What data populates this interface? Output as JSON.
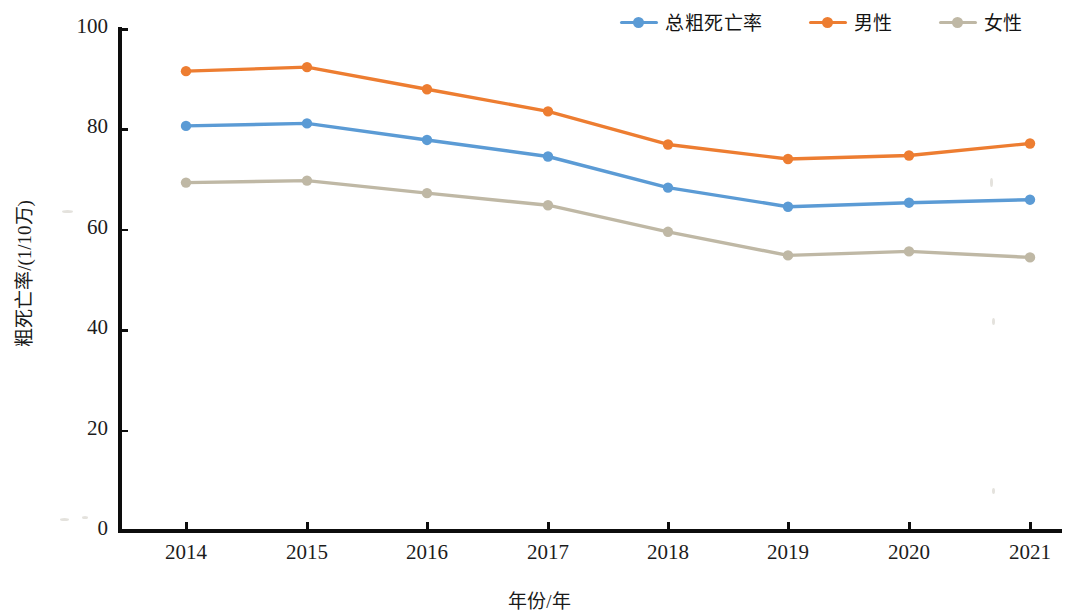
{
  "chart_data": {
    "type": "line",
    "title": "",
    "xlabel": "年份/年",
    "ylabel": "粗死亡率/(1/10万)",
    "categories": [
      "2014",
      "2015",
      "2016",
      "2017",
      "2018",
      "2019",
      "2020",
      "2021"
    ],
    "x": [
      2014,
      2015,
      2016,
      2017,
      2018,
      2019,
      2020,
      2021
    ],
    "ylim": [
      0,
      100
    ],
    "yticks": [
      0,
      20,
      40,
      60,
      80,
      100
    ],
    "grid": false,
    "legend_position": "top-right",
    "series": [
      {
        "name": "总粗死亡率",
        "color": "#5b9bd5",
        "values": [
          80.7,
          81.2,
          77.9,
          74.6,
          68.4,
          64.6,
          65.4,
          66.0
        ]
      },
      {
        "name": "男性",
        "color": "#ed7d31",
        "values": [
          91.6,
          92.4,
          88.0,
          83.6,
          77.0,
          74.1,
          74.8,
          77.2
        ]
      },
      {
        "name": "女性",
        "color": "#bfb8a5",
        "values": [
          69.4,
          69.8,
          67.3,
          64.9,
          59.6,
          54.9,
          55.7,
          54.5
        ]
      }
    ]
  },
  "legend": {
    "items": [
      {
        "label": "总粗死亡率",
        "color": "#5b9bd5"
      },
      {
        "label": "男性",
        "color": "#ed7d31"
      },
      {
        "label": "女性",
        "color": "#bfb8a5"
      }
    ]
  },
  "axes": {
    "y_title": "粗死亡率/(1/10万)",
    "x_title": "年份/年",
    "y_tick_labels": [
      "100",
      "80",
      "60",
      "40",
      "20",
      "0"
    ],
    "x_tick_labels": [
      "2014",
      "2015",
      "2016",
      "2017",
      "2018",
      "2019",
      "2020",
      "2021"
    ]
  }
}
